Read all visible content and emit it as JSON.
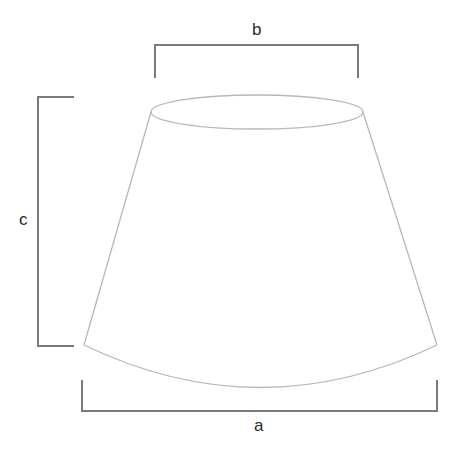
{
  "diagram": {
    "labels": {
      "top_width": "b",
      "height": "c",
      "bottom_width": "a"
    },
    "colors": {
      "bracket": "#7a7a7a",
      "shape_outline": "#b8b8b8",
      "label": "#2a2a2a",
      "background": "#ffffff"
    }
  }
}
